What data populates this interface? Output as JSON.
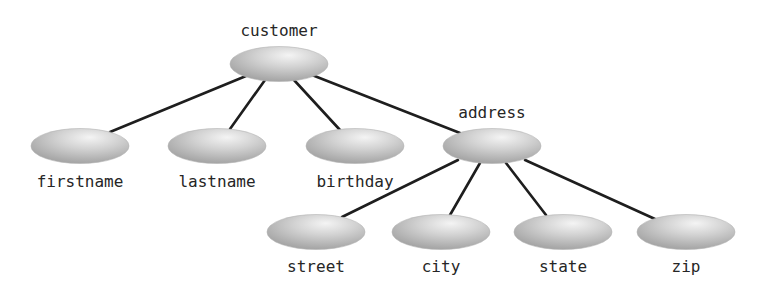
{
  "diagram": {
    "type": "tree",
    "colors": {
      "edge": "#1e1e1e",
      "node_highlight": "#f2f2f2",
      "node_mid": "#cfcfcf",
      "node_edge": "#a6a6a6",
      "label": "#262626",
      "background": "#ffffff"
    },
    "nodes": [
      {
        "id": "customer",
        "label": "customer",
        "level": 0,
        "parent": null,
        "cx": 279,
        "cy": 64,
        "label_x": 279,
        "label_y": 36
      },
      {
        "id": "firstname",
        "label": "firstname",
        "level": 1,
        "parent": "customer",
        "cx": 80,
        "cy": 146,
        "label_x": 80,
        "label_y": 187
      },
      {
        "id": "lastname",
        "label": "lastname",
        "level": 1,
        "parent": "customer",
        "cx": 217,
        "cy": 146,
        "label_x": 217,
        "label_y": 187
      },
      {
        "id": "birthday",
        "label": "birthday",
        "level": 1,
        "parent": "customer",
        "cx": 355,
        "cy": 146,
        "label_x": 355,
        "label_y": 187
      },
      {
        "id": "address",
        "label": "address",
        "level": 1,
        "parent": "customer",
        "cx": 492,
        "cy": 146,
        "label_x": 492,
        "label_y": 118
      },
      {
        "id": "street",
        "label": "street",
        "level": 2,
        "parent": "address",
        "cx": 316,
        "cy": 232,
        "label_x": 316,
        "label_y": 272
      },
      {
        "id": "city",
        "label": "city",
        "level": 2,
        "parent": "address",
        "cx": 441,
        "cy": 232,
        "label_x": 441,
        "label_y": 272
      },
      {
        "id": "state",
        "label": "state",
        "level": 2,
        "parent": "address",
        "cx": 563,
        "cy": 232,
        "label_x": 563,
        "label_y": 272
      },
      {
        "id": "zip",
        "label": "zip",
        "level": 2,
        "parent": "address",
        "cx": 686,
        "cy": 232,
        "label_x": 686,
        "label_y": 272
      }
    ],
    "edges": [
      {
        "from": "customer",
        "to": "firstname",
        "x1": 246,
        "y1": 76,
        "x2": 110,
        "y2": 132
      },
      {
        "from": "customer",
        "to": "lastname",
        "x1": 265,
        "y1": 80,
        "x2": 230,
        "y2": 129
      },
      {
        "from": "customer",
        "to": "birthday",
        "x1": 294,
        "y1": 80,
        "x2": 340,
        "y2": 130
      },
      {
        "from": "customer",
        "to": "address",
        "x1": 312,
        "y1": 75,
        "x2": 460,
        "y2": 133
      },
      {
        "from": "address",
        "to": "street",
        "x1": 458,
        "y1": 160,
        "x2": 342,
        "y2": 217
      },
      {
        "from": "address",
        "to": "city",
        "x1": 480,
        "y1": 163,
        "x2": 450,
        "y2": 215
      },
      {
        "from": "address",
        "to": "state",
        "x1": 506,
        "y1": 163,
        "x2": 546,
        "y2": 215
      },
      {
        "from": "address",
        "to": "zip",
        "x1": 525,
        "y1": 160,
        "x2": 655,
        "y2": 219
      }
    ]
  }
}
